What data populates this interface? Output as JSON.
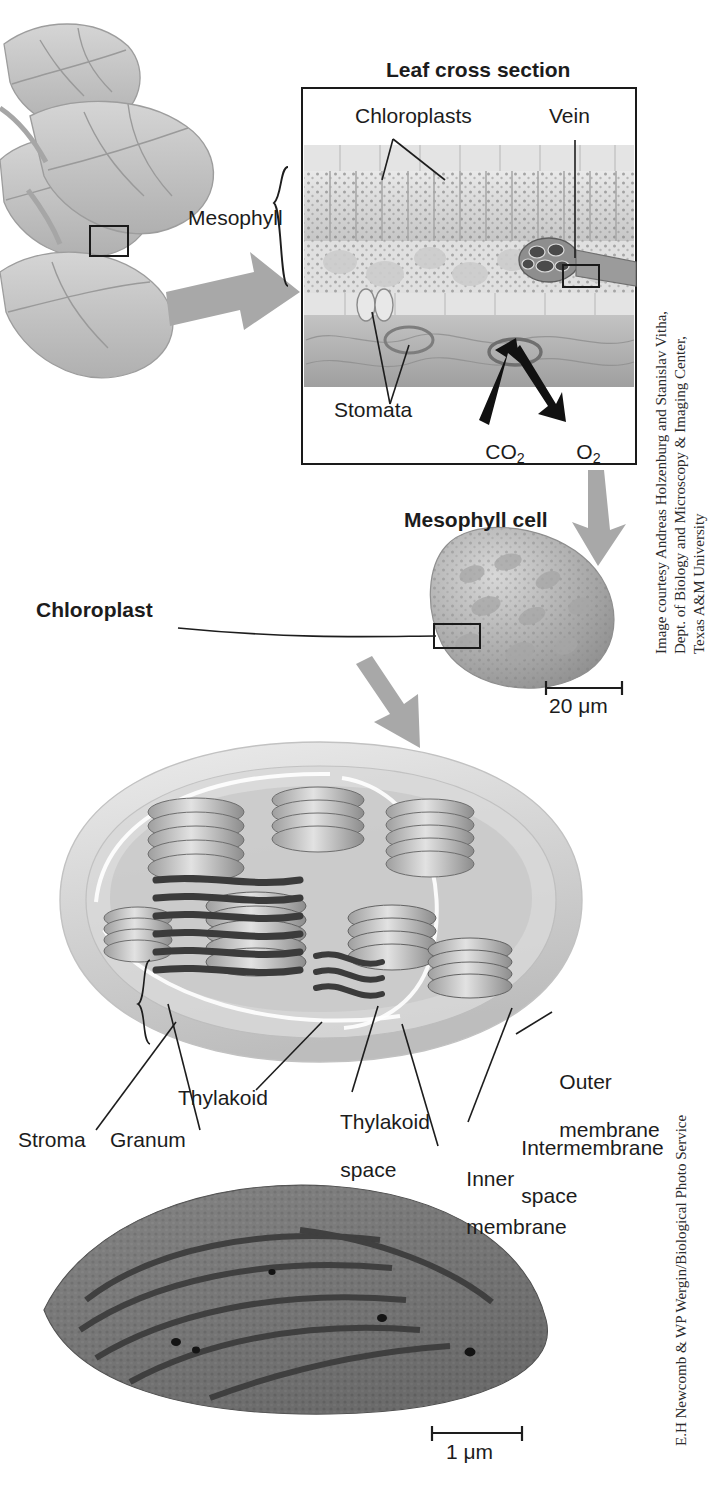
{
  "figure": {
    "title_leaf": "Leaf cross section",
    "title_mesophyll_cell": "Mesophyll cell",
    "title_chloroplast": "Chloroplast"
  },
  "leaf_panel": {
    "labels": {
      "chloroplasts": "Chloroplasts",
      "vein": "Vein",
      "mesophyll": "Mesophyll",
      "stomata": "Stomata",
      "co2": "CO",
      "co2_sub": "2",
      "o2": "O",
      "o2_sub": "2"
    }
  },
  "chloroplast_panel": {
    "labels": {
      "stroma": "Stroma",
      "granum": "Granum",
      "thylakoid": "Thylakoid",
      "thylakoid_space_l1": "Thylakoid",
      "thylakoid_space_l2": "space",
      "inner_membrane_l1": "Inner",
      "inner_membrane_l2": "membrane",
      "intermembrane_space_l1": "Intermembrane",
      "intermembrane_space_l2": "space",
      "outer_membrane_l1": "Outer",
      "outer_membrane_l2": "membrane"
    }
  },
  "scale_bars": {
    "mesophyll_cell": "20 μm",
    "micrograph": "1 μm"
  },
  "credits": {
    "top": "Image courtesy Andreas Holzenburg and Stanislav Vitha,\nDept. of Biology and Microscopy & Imaging Center,\nTexas A&M University",
    "bottom": "E.H Newcomb & WP Wergin/Biological Photo Service"
  },
  "colors": {
    "ink": "#1a1a1a",
    "arrow_gray": "#a8a8a8",
    "leaf_gray": "#b7b7b7",
    "tissue_gray": "#c9c9c9"
  }
}
